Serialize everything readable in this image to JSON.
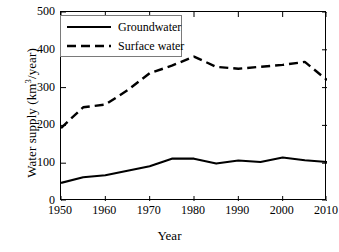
{
  "chart_data": {
    "type": "line",
    "title": "",
    "xlabel": "Year",
    "ylabel_parts": {
      "pre": "Water supply (km",
      "sup": "3",
      "post": "/year)"
    },
    "ylabel": "Water supply (km3/year)",
    "xlim": [
      1950,
      2010
    ],
    "ylim": [
      0,
      500
    ],
    "xticks": [
      "1950",
      "1960",
      "1970",
      "1980",
      "1990",
      "2000",
      "2010"
    ],
    "yticks": [
      "0",
      "100",
      "200",
      "300",
      "400",
      "500"
    ],
    "grid": false,
    "legend_position": "top-left",
    "x": [
      1950,
      1955,
      1960,
      1965,
      1970,
      1975,
      1980,
      1985,
      1990,
      1995,
      2000,
      2005,
      2010
    ],
    "series": [
      {
        "name": "Groundwater",
        "style": "solid",
        "color": "#000000",
        "values": [
          48,
          63,
          68,
          80,
          92,
          112,
          112,
          99,
          107,
          103,
          115,
          108,
          103
        ]
      },
      {
        "name": "Surface water",
        "style": "dashed",
        "color": "#000000",
        "values": [
          193,
          248,
          255,
          293,
          338,
          358,
          382,
          355,
          350,
          355,
          360,
          368,
          320
        ]
      }
    ]
  },
  "legend": {
    "items": [
      {
        "label": "Groundwater",
        "style": "solid"
      },
      {
        "label": "Surface water",
        "style": "dashed"
      }
    ]
  }
}
